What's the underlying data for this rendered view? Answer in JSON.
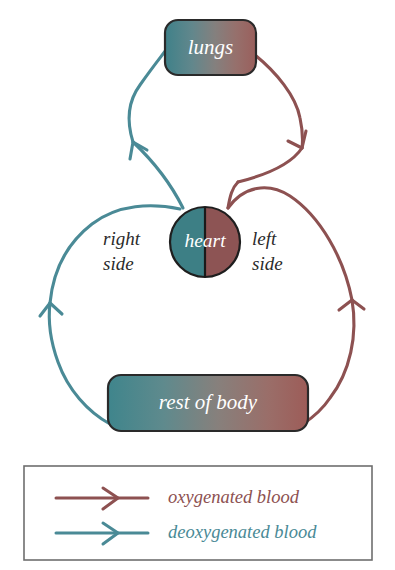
{
  "diagram": {
    "background_color": "#ffffff",
    "nodes": [
      {
        "id": "lungs",
        "label": "lungs",
        "shape": "rounded-rect"
      },
      {
        "id": "heart",
        "label": "heart",
        "shape": "circle-split"
      },
      {
        "id": "rest-of-body",
        "label": "rest of body",
        "shape": "rounded-rect"
      }
    ],
    "annotations": [
      {
        "id": "right-side",
        "line1": "right",
        "line2": "side"
      },
      {
        "id": "left-side",
        "line1": "left",
        "line2": "side"
      }
    ],
    "edges": [
      {
        "id": "heart-to-lungs",
        "type": "deoxygenated",
        "from": "heart-right-side",
        "to": "lungs"
      },
      {
        "id": "lungs-to-heart",
        "type": "oxygenated",
        "from": "lungs",
        "to": "heart-left-side"
      },
      {
        "id": "heart-to-body",
        "type": "oxygenated",
        "from": "heart-left-side",
        "to": "rest-of-body"
      },
      {
        "id": "body-to-heart",
        "type": "deoxygenated",
        "from": "rest-of-body",
        "to": "heart-right-side"
      }
    ]
  },
  "colors": {
    "oxygenated": "#8d5151",
    "oxygenated_light": "#a06a6a",
    "deoxygenated": "#4a8a96",
    "deoxygenated_light": "#5f9aa4",
    "heart_right_side_fill": "#3d7f85",
    "heart_left_side_fill": "#8d5454",
    "node_stroke": "#2a2a2a",
    "label_text": "#ffffff",
    "side_label_text": "#2b2b2b",
    "legend_border": "#6e6e6e",
    "background": "#ffffff"
  },
  "legend": {
    "items": [
      {
        "id": "legend-oxygenated",
        "label": "oxygenated blood",
        "color": "#8d5151",
        "marker": "arrow-right-icon"
      },
      {
        "id": "legend-deoxygenated",
        "label": "deoxygenated blood",
        "color": "#4a8a96",
        "marker": "arrow-right-icon"
      }
    ]
  }
}
